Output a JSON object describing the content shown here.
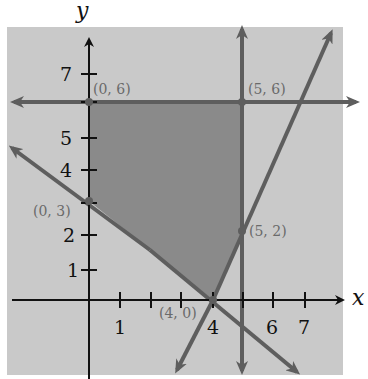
{
  "figure": {
    "axis_labels": {
      "x": "x",
      "y": "y"
    },
    "x_ticks": [
      {
        "value": 1,
        "label": "1"
      },
      {
        "value": 2,
        "label": ""
      },
      {
        "value": 3,
        "label": ""
      },
      {
        "value": 4,
        "label": "4"
      },
      {
        "value": 5,
        "label": ""
      },
      {
        "value": 6,
        "label": "6"
      },
      {
        "value": 7,
        "label": "7"
      }
    ],
    "y_ticks": [
      {
        "value": 1,
        "label": "1"
      },
      {
        "value": 2,
        "label": "2"
      },
      {
        "value": 3,
        "label": ""
      },
      {
        "value": 4,
        "label": "4"
      },
      {
        "value": 5,
        "label": "5"
      },
      {
        "value": 6,
        "label": ""
      },
      {
        "value": 7,
        "label": "7"
      }
    ],
    "vertices": [
      {
        "label": "(0, 6)",
        "x": 0,
        "y": 6
      },
      {
        "label": "(5, 6)",
        "x": 5,
        "y": 6
      },
      {
        "label": "(5, 2)",
        "x": 5,
        "y": 2
      },
      {
        "label": "(4, 0)",
        "x": 4,
        "y": 0
      },
      {
        "label": "(0, 3)",
        "x": 0,
        "y": 3
      }
    ],
    "boundary_lines": [
      {
        "name": "y = 6",
        "type": "horizontal"
      },
      {
        "name": "x = 5",
        "type": "vertical"
      },
      {
        "name": "3x + 4y = 12",
        "through": [
          "(0, 3)",
          "(4, 0)"
        ]
      },
      {
        "name": "2x - y = 8",
        "through": [
          "(4, 0)",
          "(5, 2)"
        ]
      }
    ],
    "feasible_region": "pentagon (0,6)-(5,6)-(5,2)-(4,0)-(0,3)",
    "colors": {
      "panel_background": "#c9c9c9",
      "feasible_region": "#8a8a8a",
      "boundary_lines": "#5e5e5e",
      "axes": "#111111",
      "point_labels": "#6a6a6a"
    }
  }
}
